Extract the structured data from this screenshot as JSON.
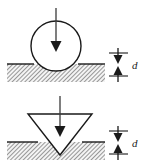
{
  "figure": {
    "background_color": "#ffffff",
    "line_color": "#1a1a1a",
    "hatch_color": "#555555",
    "specimen_fill": "#f2f2f2",
    "width": 149,
    "height": 168
  },
  "panels": [
    {
      "id": "spherical-indenter-panel",
      "indenter_shape": "circle",
      "indenter_name": "spherical ball indenter",
      "load_arrow_name": "applied-load-arrow",
      "circle": {
        "cx": 56,
        "cy": 46,
        "r": 25
      },
      "load_arrow": {
        "x": 56,
        "y_start": 8,
        "y_end": 50
      },
      "surface_y": 64,
      "specimen": {
        "x": 7,
        "y": 64,
        "width": 98,
        "height": 18
      },
      "indent_depth_label": "d",
      "dimension": {
        "x": 118,
        "y_top": 53,
        "y_bottom": 76,
        "label_x": 133,
        "label_y": 68
      }
    },
    {
      "id": "conical-indenter-panel",
      "indenter_shape": "triangle",
      "indenter_name": "conical pyramid indenter",
      "load_arrow_name": "applied-load-arrow",
      "triangle": {
        "x_left": 28,
        "x_right": 92,
        "y_top": 114,
        "x_apex": 60,
        "y_apex": 155
      },
      "load_arrow": {
        "x": 60,
        "y_start": 96,
        "y_end": 136
      },
      "surface_y": 142,
      "specimen": {
        "x": 7,
        "y": 142,
        "width": 98,
        "height": 18
      },
      "indent_depth_label": "d",
      "dimension": {
        "x": 118,
        "y_top": 131,
        "y_bottom": 154,
        "label_x": 133,
        "label_y": 146
      }
    }
  ],
  "labels": {
    "depth_symbol": "d"
  }
}
